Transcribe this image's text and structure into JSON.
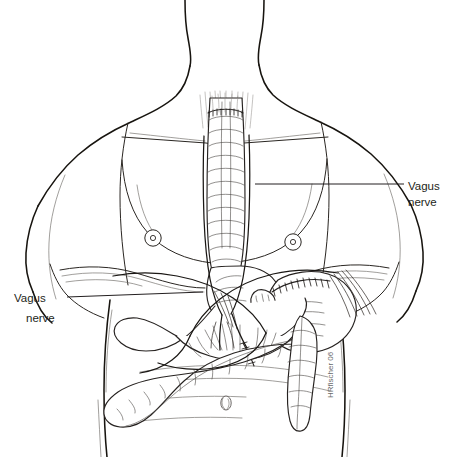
{
  "figure": {
    "background_color": "#ffffff",
    "line_color": "#17140f",
    "width": 449,
    "height": 457
  },
  "labels": {
    "right": {
      "line1": "Vagus",
      "line2": "nerve",
      "x": 408,
      "y": 186,
      "leader_from_x": 255,
      "leader_to_x": 404,
      "leader_y": 184
    },
    "left": {
      "line1": "Vagus",
      "line2": "nerve",
      "x": 14,
      "y": 301,
      "leader_from_x": 203,
      "leader_to_x": 67,
      "leader_y": 297
    }
  },
  "signature": {
    "text": "HRfischer 06",
    "x": 333,
    "y": 398,
    "rotation": -90,
    "color": "#6b6b6b"
  },
  "anatomy": {
    "structures": [
      "head-and-neck-outline",
      "shoulder-outline",
      "clavicle-line",
      "left-nipple",
      "right-nipple",
      "rib-cage-margin",
      "diaphragm",
      "umbilicus",
      "esophagus",
      "gastric-pouch",
      "stomach-remnant",
      "staple-line-pouch",
      "staple-line-jejunum",
      "roux-limb",
      "jejunum",
      "transverse-colon",
      "descending-colon",
      "vagus-nerve-anterior-trunk",
      "vagus-nerve-posterior-trunk",
      "vagus-nerve-branches"
    ],
    "nipples": [
      {
        "name": "left-nipple",
        "cx": 153,
        "cy": 238,
        "r": 8
      },
      {
        "name": "right-nipple",
        "cx": 293,
        "cy": 242,
        "r": 8
      }
    ],
    "umbilicus": {
      "cx": 226,
      "cy": 403,
      "rx": 5,
      "ry": 7
    }
  }
}
